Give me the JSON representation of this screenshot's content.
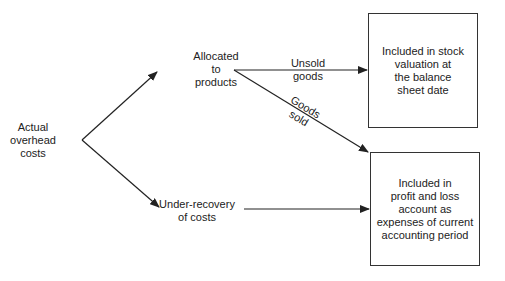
{
  "diagram": {
    "type": "flow",
    "nodes": {
      "source": {
        "label": "Actual\noverhead\ncosts"
      },
      "allocated": {
        "label": "Allocated\nto\nproducts"
      },
      "under_recovery": {
        "label": "Under-recovery\nof costs"
      },
      "stock_box": {
        "label": "Included in stock\nvaluation at\nthe balance\nsheet date"
      },
      "pl_box": {
        "label": "Included in\nprofit and loss\naccount as\nexpenses of current\naccounting period"
      }
    },
    "edges": {
      "unsold": {
        "from": "allocated",
        "to": "stock_box",
        "label": "Unsold\ngoods"
      },
      "sold": {
        "from": "allocated",
        "to": "pl_box",
        "label": "Goods\nsold"
      },
      "to_allocated": {
        "from": "source",
        "to": "allocated",
        "label": ""
      },
      "to_under": {
        "from": "source",
        "to": "under_recovery",
        "label": ""
      },
      "under_to_pl": {
        "from": "under_recovery",
        "to": "pl_box",
        "label": ""
      }
    },
    "colors": {
      "line": "#222222",
      "text": "#222222",
      "background": "#ffffff"
    }
  }
}
